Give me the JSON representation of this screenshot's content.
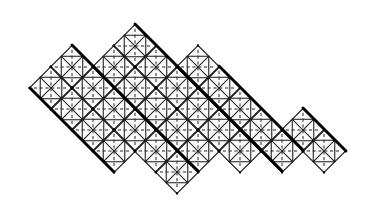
{
  "figure": {
    "caption": "",
    "background_color": "#ffffff",
    "ink_color": "#000000",
    "cell_fill_color": "#fbfbfb",
    "bold_stroke_color": "#000000",
    "dashed_stroke_color": "#262626",
    "canvas": {
      "width": 369,
      "height": 205
    }
  },
  "diagram_data": {
    "type": "lattice-diagram",
    "lattice": {
      "description": "Square cells rotated 45 degrees arranged on a diagonal lattice",
      "cell_half_width": 21.5,
      "cell_half_height": 21.5,
      "origin_x": 30.0,
      "origin_y": 88.0,
      "rotation_degrees": 45
    },
    "cell_contents": {
      "solid_diagonals": "X cross corner to corner",
      "dashed_median_horizontal": true,
      "dashed_median_vertical": true,
      "inner_diamond": "midpoint square inscribed in each cell"
    },
    "peaks": [
      {
        "label": "peak-left",
        "x": 72,
        "y": 45
      },
      {
        "label": "peak-center",
        "x": 138,
        "y": 22
      },
      {
        "label": "peak-right",
        "x": 210,
        "y": 43
      }
    ],
    "extents": {
      "leftmost_x": 30,
      "rightmost_x": 346,
      "topmost_y": 22,
      "bottommost_y": 186
    },
    "cells": [
      {
        "cx": 51,
        "cy": 88
      },
      {
        "cx": 72,
        "cy": 67
      },
      {
        "cx": 72,
        "cy": 109
      },
      {
        "cx": 93,
        "cy": 88
      },
      {
        "cx": 93,
        "cy": 130
      },
      {
        "cx": 114,
        "cy": 67
      },
      {
        "cx": 114,
        "cy": 109
      },
      {
        "cx": 114,
        "cy": 151
      },
      {
        "cx": 135,
        "cy": 46
      },
      {
        "cx": 135,
        "cy": 88
      },
      {
        "cx": 135,
        "cy": 130
      },
      {
        "cx": 156,
        "cy": 67
      },
      {
        "cx": 156,
        "cy": 109
      },
      {
        "cx": 156,
        "cy": 151
      },
      {
        "cx": 177,
        "cy": 88
      },
      {
        "cx": 177,
        "cy": 130
      },
      {
        "cx": 177,
        "cy": 172
      },
      {
        "cx": 198,
        "cy": 67
      },
      {
        "cx": 198,
        "cy": 109
      },
      {
        "cx": 198,
        "cy": 151
      },
      {
        "cx": 219,
        "cy": 88
      },
      {
        "cx": 219,
        "cy": 130
      },
      {
        "cx": 240,
        "cy": 109
      },
      {
        "cx": 240,
        "cy": 151
      },
      {
        "cx": 261,
        "cy": 130
      },
      {
        "cx": 282,
        "cy": 151
      },
      {
        "cx": 303,
        "cy": 130
      },
      {
        "cx": 324,
        "cy": 151
      }
    ],
    "bold_emphasis_lines": [
      {
        "from_x": 30,
        "from_y": 88,
        "to_x": 114,
        "to_y": 172
      },
      {
        "from_x": 72,
        "from_y": 45,
        "to_x": 198,
        "to_y": 171
      },
      {
        "from_x": 135,
        "from_y": 24,
        "to_x": 261,
        "to_y": 150
      },
      {
        "from_x": 177,
        "from_y": 66,
        "to_x": 282,
        "to_y": 171
      },
      {
        "from_x": 219,
        "from_y": 66,
        "to_x": 303,
        "to_y": 150
      },
      {
        "from_x": 303,
        "from_y": 108,
        "to_x": 346,
        "to_y": 151
      }
    ]
  },
  "labels": {
    "figure_number": "",
    "axis_x": "",
    "axis_y": ""
  }
}
